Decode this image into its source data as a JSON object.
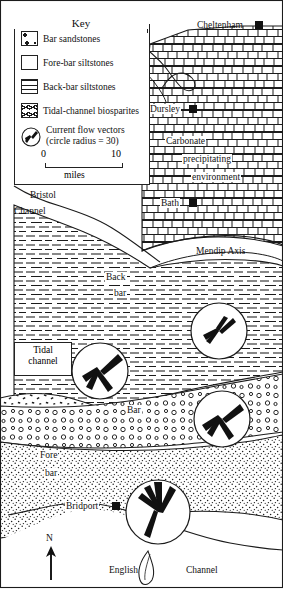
{
  "figure": {
    "kind": "paleogeographic-map",
    "region": "Southwest England — Bridport Sands / Inferior Oolite palaeogeography"
  },
  "key": {
    "title": "Key",
    "items": [
      {
        "pattern": "bar-sandstones",
        "label": "Bar sandstones"
      },
      {
        "pattern": "fore-bar-siltstones",
        "label": "Fore-bar siltstones"
      },
      {
        "pattern": "back-bar-siltstones",
        "label": "Back-bar siltstones"
      },
      {
        "pattern": "tidal-channel-biosparites",
        "label": "Tidal-channel biosparites"
      },
      {
        "pattern": "current-flow-vectors",
        "label": "Current flow vectors",
        "label2": "(circle radius = 30)"
      }
    ],
    "scale": {
      "min": "0",
      "max": "10",
      "units": "miles"
    }
  },
  "places": [
    {
      "name": "Cheltenham",
      "marker": "filled-square"
    },
    {
      "name": "Dursley",
      "marker": "filled-square"
    },
    {
      "name": "Bath",
      "marker": "filled-square"
    },
    {
      "name": "Bridport",
      "marker": "filled-square"
    }
  ],
  "annotations": {
    "carbonate_env": {
      "line1": "Carbonate",
      "line2": "precipitating",
      "line3": "environment"
    },
    "mendip_axis": "Mendip Axis",
    "bristol_channel": {
      "line1": "Bristol",
      "line2": "Channel"
    },
    "english_channel": {
      "left": "English",
      "right": "Channel"
    },
    "back_bar": {
      "line1": "Back",
      "line2": "bar"
    },
    "tidal_channel": {
      "line1": "Tidal",
      "line2": "channel"
    },
    "bar": "Bar",
    "fore_bar": {
      "line1": "Fore",
      "line2": "bar"
    },
    "north": "N"
  },
  "flow_vector_circles": [
    {
      "id": "circle-north",
      "cx": 219,
      "cy": 331,
      "r": 28
    },
    {
      "id": "circle-tidal",
      "cx": 100,
      "cy": 371,
      "r": 28
    },
    {
      "id": "circle-mid",
      "cx": 222,
      "cy": 419,
      "r": 28
    },
    {
      "id": "circle-south",
      "cx": 158,
      "cy": 512,
      "r": 32
    }
  ],
  "colors": {
    "ink": "#111111",
    "paper": "#ffffff",
    "line": "#222222"
  }
}
